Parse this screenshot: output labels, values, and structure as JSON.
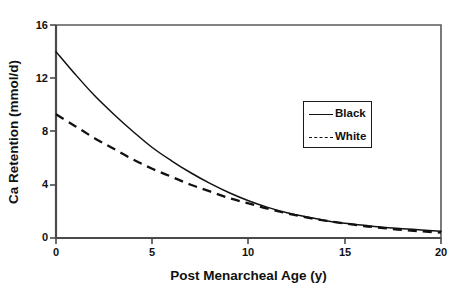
{
  "chart_data": {
    "type": "line",
    "title": "",
    "xlabel": "Post Menarcheal Age (y)",
    "ylabel": "Ca Retention (mmol/d)",
    "xlim": [
      0,
      20
    ],
    "ylim": [
      0,
      16
    ],
    "xticks": [
      0,
      5,
      10,
      15,
      20
    ],
    "yticks": [
      0,
      4,
      8,
      12,
      16
    ],
    "xtick_labels": [
      "0",
      "5",
      "10",
      "15",
      "20"
    ],
    "ytick_labels": [
      "0",
      "4",
      "8",
      "12",
      "16"
    ],
    "grid": false,
    "legend_position": "center-right",
    "x": [
      0,
      1,
      2,
      3,
      4,
      5,
      6,
      7,
      8,
      9,
      10,
      11,
      12,
      13,
      14,
      15,
      16,
      17,
      18,
      19,
      20
    ],
    "series": [
      {
        "name": "Black",
        "style": "solid",
        "color": "#111111",
        "values": [
          14.0,
          12.3,
          10.7,
          9.3,
          8.0,
          6.8,
          5.8,
          4.9,
          4.1,
          3.4,
          2.8,
          2.3,
          1.9,
          1.6,
          1.3,
          1.1,
          0.95,
          0.8,
          0.7,
          0.6,
          0.5
        ]
      },
      {
        "name": "White",
        "style": "dashed",
        "color": "#111111",
        "values": [
          9.3,
          8.4,
          7.5,
          6.7,
          5.9,
          5.2,
          4.6,
          4.0,
          3.5,
          3.0,
          2.6,
          2.2,
          1.85,
          1.55,
          1.3,
          1.1,
          0.9,
          0.75,
          0.6,
          0.5,
          0.4
        ]
      }
    ]
  },
  "legend": {
    "entries": [
      {
        "label": "Black"
      },
      {
        "label": "White"
      }
    ]
  },
  "axes": {
    "x_title": "Post Menarcheal Age (y)",
    "y_title": "Ca Retention (mmol/d)"
  }
}
